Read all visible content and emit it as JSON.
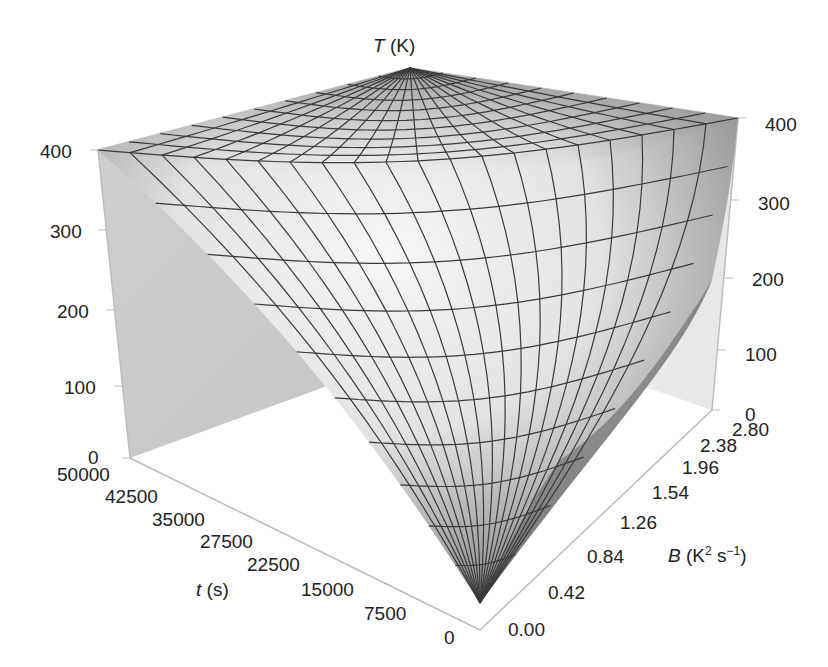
{
  "chart_data": {
    "type": "surface3d",
    "title": "",
    "zlabel_var": "T",
    "zlabel_unit": "(K)",
    "xlabel_var": "t",
    "xlabel_unit": "(s)",
    "ylabel_var": "B",
    "ylabel_unit_base": "(K",
    "ylabel_unit_sup1": "2",
    "ylabel_unit_mid": " s",
    "ylabel_unit_sup2": "−1",
    "ylabel_unit_end": ")",
    "z_ticks": [
      "0",
      "100",
      "200",
      "300",
      "400"
    ],
    "t_ticks": [
      "50000",
      "42500",
      "35000",
      "27500",
      "22500",
      "15000",
      "7500",
      "0"
    ],
    "B_ticks": [
      "0.00",
      "0.42",
      "0.84",
      "1.26",
      "1.54",
      "1.96",
      "2.38",
      "2.80"
    ],
    "zlim": [
      0,
      400
    ],
    "xlim": [
      0,
      50000
    ],
    "ylim": [
      0.0,
      2.8
    ],
    "surface_description": "T ≈ 400 K across most of the domain; drops steeply toward 0 as t → 0, with the drop extending further for larger B",
    "grid_mesh": "20 x 20 wireframe",
    "colors": {
      "surface_light": "#f2f2f2",
      "surface_dark": "#5a5a5a",
      "wall": "#d0d0d0",
      "mesh": "#3a3a3a"
    }
  },
  "labels": {
    "z_title_var": "T",
    "z_title_unit": "(K)",
    "t_title_var": "t",
    "t_title_unit": "(s)",
    "B_title_var": "B"
  }
}
